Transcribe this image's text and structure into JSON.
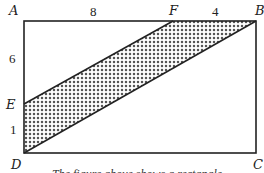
{
  "figure": {
    "vertices": {
      "A": {
        "label": "A",
        "x": 24,
        "y": 21
      },
      "B": {
        "label": "B",
        "x": 256,
        "y": 21
      },
      "C": {
        "label": "C",
        "x": 256,
        "y": 153
      },
      "D": {
        "label": "D",
        "x": 24,
        "y": 153
      },
      "E": {
        "label": "E",
        "x": 24,
        "y": 104
      },
      "F": {
        "label": "F",
        "x": 173,
        "y": 21
      }
    },
    "segment_labels": {
      "AF": "8",
      "FB": "4",
      "AE": "6",
      "ED": "1"
    },
    "shaded_region": "EFBD",
    "colors": {
      "line": "#222222",
      "fill_dot": "#555555",
      "background": "#ffffff"
    }
  },
  "caption": "The figure above shows a rectangle"
}
